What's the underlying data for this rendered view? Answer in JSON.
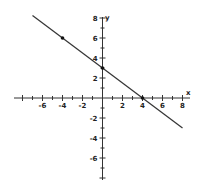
{
  "chart_data": {
    "type": "line",
    "title": "",
    "xlabel": "x",
    "ylabel": "y",
    "xlim": [
      -8,
      8
    ],
    "ylim": [
      -8,
      8
    ],
    "grid": false,
    "x_ticks": [
      -6,
      -4,
      -2,
      2,
      4,
      6,
      8
    ],
    "y_ticks": [
      8,
      6,
      4,
      2,
      -2,
      -4,
      -6
    ],
    "minor_tick_step": 1,
    "series": [
      {
        "name": "line",
        "equation": "y = -3/4 x + 3",
        "x": [
          -7,
          8
        ],
        "y": [
          8.25,
          -3
        ]
      }
    ],
    "points": [
      {
        "x": -4,
        "y": 6
      },
      {
        "x": 0,
        "y": 3
      },
      {
        "x": 4,
        "y": 0
      }
    ],
    "colors": {
      "line": "#333333",
      "axis": "#333333",
      "point": "#111111"
    }
  },
  "labels": {
    "x_axis": "x",
    "y_axis": "y",
    "x_ticks": [
      "-6",
      "-4",
      "-2",
      "2",
      "4",
      "6",
      "8"
    ],
    "y_ticks": [
      "8",
      "6",
      "4",
      "2",
      "-2",
      "-4",
      "-6"
    ]
  }
}
